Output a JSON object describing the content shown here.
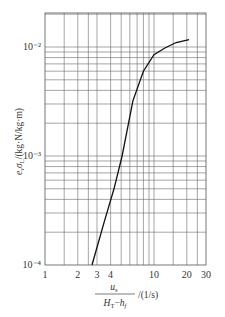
{
  "chart_data": {
    "type": "line",
    "title": "",
    "xlabel": "u_s / (H_T - h_f) /(1/s)",
    "ylabel": "e_v σ_L /(kg·N/kg·m)",
    "xscale": "log",
    "yscale": "log",
    "xlim": [
      1,
      30
    ],
    "ylim": [
      0.0001,
      0.02
    ],
    "grid": true,
    "legend": null,
    "x_tick_labels": [
      "1",
      "2",
      "3",
      "4",
      "10",
      "20",
      "30"
    ],
    "x_ticks": [
      1,
      2,
      3,
      4,
      10,
      20,
      30
    ],
    "y_tick_labels": [
      "10⁻⁴",
      "10⁻³",
      "10⁻²"
    ],
    "y_ticks": [
      0.0001,
      0.001,
      0.01
    ],
    "series": [
      {
        "name": "e_v σ_L",
        "x": [
          2.7,
          3.5,
          4.3,
          5.1,
          6.4,
          8.0,
          10.0,
          12.6,
          16.0,
          21.0
        ],
        "y": [
          0.0001,
          0.00025,
          0.0005,
          0.001,
          0.0032,
          0.006,
          0.0085,
          0.0098,
          0.011,
          0.0117
        ]
      }
    ]
  },
  "labels": {
    "x_numerator": "u",
    "x_numerator_sub": "s",
    "x_denominator_a": "H",
    "x_denominator_a_sub": "T",
    "x_denominator_b": "h",
    "x_denominator_b_sub": "f",
    "x_unit": "/(1/s)",
    "y_text": "e",
    "y_text_sub": "v",
    "y_sigma": "σ",
    "y_sigma_sub": "L",
    "y_unit": "/(kg·N/kg·m)"
  }
}
